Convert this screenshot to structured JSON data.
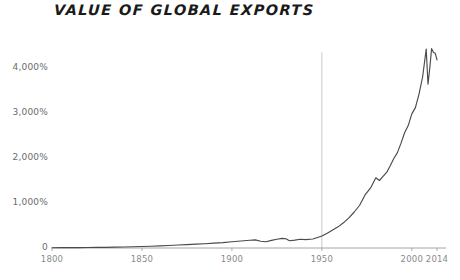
{
  "chart_data": {
    "type": "line",
    "title": "VALUE OF GLOBAL EXPORTS",
    "xlabel": "",
    "ylabel": "",
    "xlim": [
      1800,
      2014
    ],
    "ylim": [
      0,
      4600
    ],
    "grid": false,
    "legend": "none",
    "line_color": "#4a4a4a",
    "axis_color": "#9a9a9a",
    "marker_line_color": "#c9c9c9",
    "marker_line_year": 1950,
    "y_tick_labels": [
      "4,000%",
      "3,000%",
      "2,000%",
      "1,000%",
      "0"
    ],
    "y_tick_values": [
      4000,
      3000,
      2000,
      1000,
      0
    ],
    "x_tick_labels": [
      "1800",
      "1850",
      "1900",
      "1950",
      "2000",
      "2014"
    ],
    "x_tick_values": [
      1800,
      1850,
      1900,
      1950,
      2000,
      2014
    ],
    "series": [
      {
        "name": "Value of global exports (index, 1913 = 100 scaled to percent growth)",
        "x": [
          1800,
          1805,
          1810,
          1815,
          1820,
          1825,
          1830,
          1835,
          1840,
          1845,
          1850,
          1855,
          1860,
          1865,
          1870,
          1875,
          1880,
          1885,
          1890,
          1895,
          1900,
          1905,
          1910,
          1913,
          1916,
          1919,
          1922,
          1925,
          1928,
          1930,
          1932,
          1935,
          1938,
          1941,
          1945,
          1948,
          1950,
          1953,
          1956,
          1959,
          1962,
          1965,
          1968,
          1971,
          1974,
          1977,
          1980,
          1982,
          1984,
          1986,
          1988,
          1990,
          1992,
          1994,
          1996,
          1998,
          2000,
          2002,
          2004,
          2006,
          2008,
          2009,
          2010,
          2011,
          2012,
          2013,
          2014
        ],
        "y": [
          6,
          7,
          8,
          9,
          11,
          13,
          15,
          18,
          22,
          27,
          33,
          40,
          48,
          55,
          66,
          75,
          86,
          95,
          108,
          120,
          138,
          155,
          172,
          180,
          150,
          140,
          170,
          195,
          215,
          205,
          160,
          175,
          195,
          185,
          200,
          240,
          265,
          330,
          400,
          470,
          560,
          670,
          800,
          950,
          1180,
          1330,
          1560,
          1500,
          1590,
          1680,
          1830,
          1990,
          2120,
          2330,
          2560,
          2720,
          2980,
          3120,
          3420,
          3800,
          4420,
          3640,
          4000,
          4430,
          4350,
          4330,
          4180
        ]
      }
    ],
    "annotations": [
      {
        "type": "vertical-line",
        "x": 1950,
        "y_top": 4350,
        "y_bottom": 0
      }
    ]
  }
}
